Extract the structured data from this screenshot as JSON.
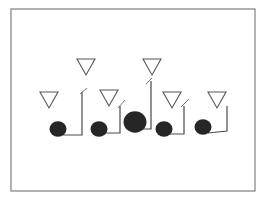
{
  "diagram": {
    "type": "football-play-diagram",
    "frame": {
      "x": 11,
      "y": 9,
      "width": 244,
      "height": 182,
      "stroke": "#8a8a8a"
    },
    "colors": {
      "offense_fill": "#262626",
      "defender_stroke": "#555555",
      "route_stroke": "#4a4a4a",
      "background": "#ffffff"
    },
    "defenders": [
      {
        "id": "D1",
        "shape": "triangle-down",
        "cx": 49,
        "top": 92,
        "bottom": 108,
        "half_width": 9
      },
      {
        "id": "D2",
        "shape": "triangle-down",
        "cx": 86,
        "top": 59,
        "bottom": 75,
        "half_width": 9
      },
      {
        "id": "D3",
        "shape": "triangle-down",
        "cx": 109,
        "top": 90,
        "bottom": 106,
        "half_width": 9
      },
      {
        "id": "D4",
        "shape": "triangle-down",
        "cx": 152,
        "top": 59,
        "bottom": 75,
        "half_width": 9
      },
      {
        "id": "D5",
        "shape": "triangle-down",
        "cx": 172,
        "top": 92,
        "bottom": 108,
        "half_width": 9
      },
      {
        "id": "D6",
        "shape": "triangle-down",
        "cx": 217,
        "top": 92,
        "bottom": 108,
        "half_width": 9
      }
    ],
    "offense": [
      {
        "id": "O1",
        "shape": "circle",
        "cx": 58,
        "cy": 129,
        "r": 8
      },
      {
        "id": "O2",
        "shape": "circle",
        "cx": 99,
        "cy": 129,
        "r": 8
      },
      {
        "id": "O3",
        "shape": "circle",
        "cx": 135,
        "cy": 122,
        "r": 11
      },
      {
        "id": "O4",
        "shape": "circle",
        "cx": 164,
        "cy": 129,
        "r": 8
      },
      {
        "id": "O5",
        "shape": "circle",
        "cx": 203,
        "cy": 127,
        "r": 8
      }
    ],
    "routes": [
      {
        "id": "R1",
        "from": "O1",
        "points": "63,135 82,135 82,92",
        "tick": "80,94 87,88"
      },
      {
        "id": "R2",
        "from": "O2",
        "points": "105,133 120,133 120,106",
        "tick": "118,108 125,100"
      },
      {
        "id": "R3",
        "from": "O3",
        "points": "142,129 151,129 151,81",
        "tick": "146,84 152,78"
      },
      {
        "id": "R4",
        "from": "O4",
        "points": "170,134 184,134 184,106",
        "tick": "181,107 189,99"
      },
      {
        "id": "R5",
        "from": "O5",
        "points": "208,133 227,131 227,106",
        "tick": ""
      }
    ]
  },
  "caption": {
    "text": ""
  }
}
